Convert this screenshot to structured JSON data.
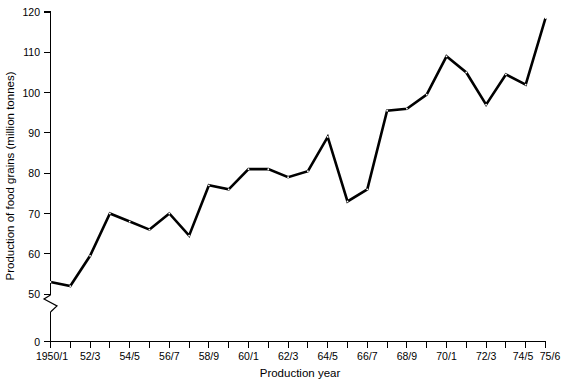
{
  "chart_data": {
    "type": "line",
    "title": "",
    "xlabel": "Production year",
    "ylabel": "Production of food grains (million tonnes)",
    "categories": [
      "1950/1",
      "51/2",
      "52/3",
      "53/4",
      "54/5",
      "55/6",
      "56/7",
      "57/8",
      "58/9",
      "59/60",
      "60/1",
      "61/2",
      "62/3",
      "63/4",
      "64/5",
      "65/6",
      "66/7",
      "67/8",
      "68/9",
      "69/70",
      "70/1",
      "71/2",
      "72/3",
      "73/4",
      "74/5",
      "75/6"
    ],
    "x_tick_labels": [
      "1950/1",
      "52/3",
      "54/5",
      "56/7",
      "58/9",
      "60/1",
      "62/3",
      "64/5",
      "66/7",
      "68/9",
      "70/1",
      "72/3",
      "74/5",
      "75/6"
    ],
    "values": [
      53,
      52,
      59.5,
      70,
      68,
      66,
      70,
      64.5,
      77,
      76,
      81,
      81,
      79,
      80.5,
      89,
      73,
      76,
      95.5,
      96,
      99.5,
      109,
      105,
      97,
      104.5,
      102,
      118.5
    ],
    "ylim": [
      50,
      120
    ],
    "y_tick_labels": [
      "0",
      "50",
      "60",
      "70",
      "80",
      "90",
      "100",
      "110",
      "120"
    ],
    "y_ticks": [
      50,
      60,
      70,
      80,
      90,
      100,
      110,
      120
    ],
    "y_axis_break": true,
    "y_axis_break_note": "axis broken between 0 and 50",
    "grid": false,
    "legend": null,
    "marker": "dot",
    "line_color": "#000000"
  },
  "axes": {
    "x_axis_label": "Production year",
    "y_axis_label": "Production of food grains (million tonnes)",
    "zero_label": "0"
  }
}
